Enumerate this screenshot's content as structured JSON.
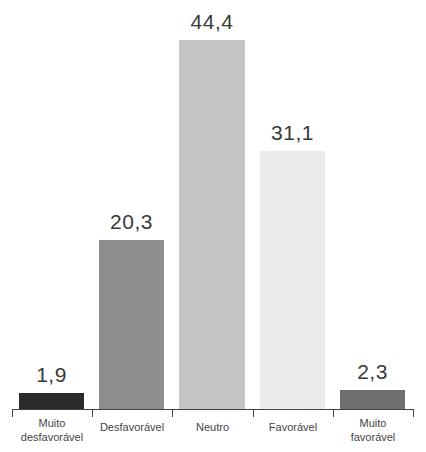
{
  "chart_data": {
    "type": "bar",
    "title": "",
    "xlabel": "",
    "ylabel": "",
    "categories": [
      "Muito desfavorável",
      "Desfavorável",
      "Neutro",
      "Favorável",
      "Muito favorável"
    ],
    "category_lines": [
      [
        "Muito",
        "desfavorável"
      ],
      [
        "Desfavorável"
      ],
      [
        "Neutro"
      ],
      [
        "Favorável"
      ],
      [
        "Muito",
        "favorável"
      ]
    ],
    "values": [
      1.9,
      20.3,
      44.4,
      31.1,
      2.3
    ],
    "value_labels": [
      "1,9",
      "20,3",
      "44,4",
      "31,1",
      "2,3"
    ],
    "bar_colors": [
      "#2b2b2b",
      "#8e8e8e",
      "#c4c4c4",
      "#ebebeb",
      "#6f6f6f"
    ],
    "ylim": [
      0,
      44.4
    ],
    "grid": false,
    "legend": "none"
  }
}
